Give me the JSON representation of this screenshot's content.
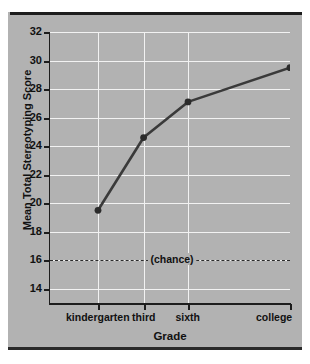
{
  "chart_data": {
    "type": "line",
    "title": "",
    "xlabel": "Grade",
    "ylabel": "Mean Total Stereotyping Score",
    "categories": [
      "kindergarten",
      "third",
      "sixth",
      "college"
    ],
    "values": [
      19.5,
      24.6,
      27.1,
      29.5
    ],
    "series": [
      {
        "name": "Mean Total Stereotyping Score",
        "values": [
          19.5,
          24.6,
          27.1,
          29.5
        ]
      }
    ],
    "ylim": [
      13,
      32
    ],
    "yticks": [
      14,
      16,
      18,
      20,
      22,
      24,
      26,
      28,
      30,
      32
    ],
    "ytick_labels": [
      "14",
      "16",
      "18",
      "20",
      "22",
      "24",
      "26",
      "28",
      "30",
      "32"
    ],
    "xtick_positions": [
      0.2,
      0.39,
      0.575,
      1.0
    ],
    "grid": true,
    "legend": "none",
    "annotations": [
      {
        "name": "chance-line",
        "label": "(chance)",
        "y": 16,
        "style": "dashed-horizontal"
      }
    ],
    "colors": {
      "panel_background": "#b2b2b2",
      "plot_background": "#b2b2b2",
      "gridline": "#f2f2f2",
      "axis": "#1d1d1d",
      "series_line": "#3a3a3a",
      "marker": "#2b2b2b",
      "text": "#111111",
      "rule": "#1d1d1d"
    }
  }
}
